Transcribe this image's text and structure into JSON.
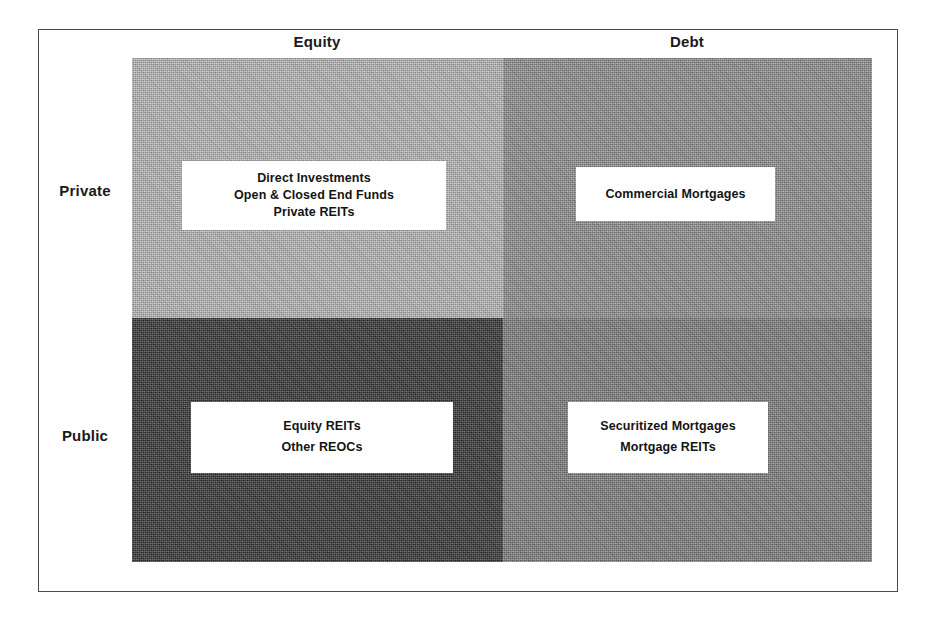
{
  "diagram": {
    "type": "2x2-matrix",
    "column_headers": [
      {
        "id": "equity",
        "label": "Equity"
      },
      {
        "id": "debt",
        "label": "Debt"
      }
    ],
    "row_headers": [
      {
        "id": "private",
        "label": "Private"
      },
      {
        "id": "public",
        "label": "Public"
      }
    ],
    "quadrants": {
      "private_equity": {
        "row": "Private",
        "column": "Equity",
        "fill_color": "#b9b9b9",
        "items": [
          "Direct Investments",
          "Open & Closed End Funds",
          "Private REITs"
        ]
      },
      "private_debt": {
        "row": "Private",
        "column": "Debt",
        "fill_color": "#8e8e8e",
        "items": [
          "Commercial Mortgages"
        ]
      },
      "public_equity": {
        "row": "Public",
        "column": "Equity",
        "fill_color": "#2e2e2e",
        "items": [
          "Equity REITs",
          "Other REOCs"
        ]
      },
      "public_debt": {
        "row": "Public",
        "column": "Debt",
        "fill_color": "#7c7c7c",
        "items": [
          "Securitized Mortgages",
          "Mortgage REITs"
        ]
      }
    },
    "colors": {
      "page_background": "#ffffff",
      "frame_border": "#4a4a4a",
      "box_background": "#ffffff",
      "text": "#141414"
    }
  }
}
